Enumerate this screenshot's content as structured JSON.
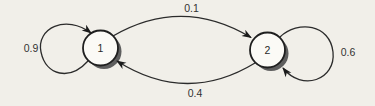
{
  "figure": {
    "type": "state-transition-diagram",
    "states": [
      {
        "id": "1",
        "label": "1"
      },
      {
        "id": "2",
        "label": "2"
      }
    ],
    "transitions": [
      {
        "from": "1",
        "to": "1",
        "label": "0.9"
      },
      {
        "from": "1",
        "to": "2",
        "label": "0.1"
      },
      {
        "from": "2",
        "to": "1",
        "label": "0.4"
      },
      {
        "from": "2",
        "to": "2",
        "label": "0.6"
      }
    ],
    "colors": {
      "background": "#f1efe9",
      "line": "#2b2b2b",
      "node_fill": "#fbfaf6",
      "node_shadow": "#5e5e5e",
      "text": "#323232"
    }
  }
}
